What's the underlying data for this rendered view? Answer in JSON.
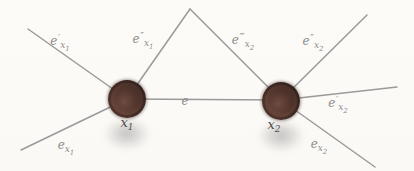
{
  "figure": {
    "width": 414,
    "height": 171,
    "background": "#fcfbf8",
    "edge_color": "#9a9a9a",
    "edge_width": 1.5,
    "label_color": "#8d8d8d",
    "node_style": {
      "radius": 19,
      "label_color": "#524c49",
      "fill_center": "#6e4c42",
      "fill_edge": "#33211d"
    },
    "nodes": [
      {
        "name": "node-x1",
        "base": "x",
        "sub": "1",
        "cx": 127,
        "cy": 99,
        "label_x": 127,
        "label_y": 122,
        "shadow_cx": 127,
        "shadow_cy": 135,
        "shadow_w": 46,
        "shadow_h": 30
      },
      {
        "name": "node-x2",
        "base": "x",
        "sub": "2",
        "cx": 281,
        "cy": 101,
        "label_x": 274,
        "label_y": 124,
        "shadow_cx": 281,
        "shadow_cy": 137,
        "shadow_w": 46,
        "shadow_h": 30
      }
    ],
    "edges": [
      {
        "name": "edge-e-prime-x1",
        "x1": 28,
        "y1": 29,
        "x2": 127,
        "y2": 99
      },
      {
        "name": "edge-e-double-prime-x1",
        "x1": 127,
        "y1": 99,
        "x2": 190,
        "y2": 9
      },
      {
        "name": "edge-e-triple-prime-x2",
        "x1": 190,
        "y1": 9,
        "x2": 281,
        "y2": 100
      },
      {
        "name": "edge-e-double-prime-x2",
        "x1": 281,
        "y1": 100,
        "x2": 367,
        "y2": 15
      },
      {
        "name": "edge-e",
        "x1": 127,
        "y1": 99,
        "x2": 281,
        "y2": 100
      },
      {
        "name": "edge-e-x1",
        "x1": 127,
        "y1": 99,
        "x2": 21,
        "y2": 150
      },
      {
        "name": "edge-e-prime-x2",
        "x1": 281,
        "y1": 100,
        "x2": 397,
        "y2": 87
      },
      {
        "name": "edge-e-x2",
        "x1": 281,
        "y1": 100,
        "x2": 375,
        "y2": 167
      }
    ],
    "edge_labels": [
      {
        "name": "label-e-prime-x1",
        "base": "e",
        "primes": "′",
        "sub": "x",
        "subsub": "1",
        "x": 60,
        "y": 42
      },
      {
        "name": "label-e-double-prime-x1",
        "base": "e",
        "primes": "″",
        "sub": "x",
        "subsub": "1",
        "x": 143,
        "y": 40
      },
      {
        "name": "label-e-triple-prime-x2",
        "base": "e",
        "primes": "‴",
        "sub": "x",
        "subsub": "2",
        "x": 243,
        "y": 41
      },
      {
        "name": "label-e-double-prime-x2",
        "base": "e",
        "primes": "″",
        "sub": "x",
        "subsub": "2",
        "x": 313,
        "y": 42
      },
      {
        "name": "label-e",
        "base": "e",
        "primes": "",
        "sub": "",
        "subsub": "",
        "x": 185,
        "y": 101
      },
      {
        "name": "label-e-x1",
        "base": "e",
        "primes": "",
        "sub": "x",
        "subsub": "1",
        "x": 66,
        "y": 146
      },
      {
        "name": "label-e-prime-x2",
        "base": "e",
        "primes": "′",
        "sub": "x",
        "subsub": "2",
        "x": 338,
        "y": 104
      },
      {
        "name": "label-e-x2",
        "base": "e",
        "primes": "",
        "sub": "x",
        "subsub": "2",
        "x": 319,
        "y": 145
      }
    ]
  }
}
